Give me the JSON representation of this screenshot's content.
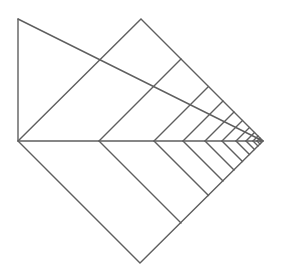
{
  "diagram": {
    "stroke_color": "#5f5f5f",
    "background": "#ffffff",
    "diamond": {
      "top": [
        141,
        19
      ],
      "right": [
        263,
        141
      ],
      "bottom": [
        140,
        263
      ],
      "left": [
        18,
        141
      ]
    },
    "vertical_line": {
      "from": [
        18,
        19
      ],
      "to": [
        18,
        141
      ]
    },
    "diagonal_line": {
      "from": [
        18,
        19
      ],
      "to": [
        263,
        141
      ]
    },
    "horizontal_axis": {
      "from": [
        18,
        141
      ],
      "to": [
        263,
        141
      ]
    },
    "chevron_x_positions": [
      99,
      154,
      183,
      205,
      222,
      236,
      246,
      253,
      257,
      260
    ]
  }
}
